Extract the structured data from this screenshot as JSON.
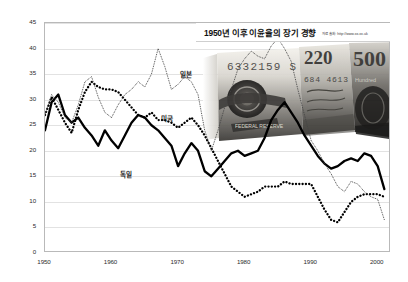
{
  "chart_data": {
    "type": "line",
    "title": "1950년 이후 이윤율의 장기 경향",
    "source_note": "자료 출처: http://www.xx.xx.uk",
    "xlabel": "",
    "ylabel": "",
    "xlim": [
      1950,
      2002
    ],
    "ylim": [
      0,
      45
    ],
    "ytick_step": 5,
    "yticks": [
      "45",
      "40",
      "35",
      "30",
      "25",
      "20",
      "15",
      "10",
      "5",
      "0"
    ],
    "xticks": [
      "1950",
      "1960",
      "1970",
      "1980",
      "1990",
      "2000"
    ],
    "grid": true,
    "legend_position": "inline-annotations",
    "series": [
      {
        "name": "미국",
        "label": "미국",
        "style": "thick-solid",
        "color": "#000000",
        "x": [
          1950,
          1951,
          1952,
          1953,
          1954,
          1955,
          1956,
          1957,
          1958,
          1959,
          1960,
          1961,
          1962,
          1963,
          1964,
          1965,
          1966,
          1967,
          1968,
          1969,
          1970,
          1971,
          1972,
          1973,
          1974,
          1975,
          1976,
          1977,
          1978,
          1979,
          1980,
          1981,
          1982,
          1983,
          1984,
          1985,
          1986,
          1987,
          1988,
          1989,
          1990,
          1991,
          1992,
          1993,
          1994,
          1995,
          1996,
          1997,
          1998,
          1999,
          2000,
          2001
        ],
        "values": [
          24.0,
          29.5,
          31.0,
          27.0,
          25.5,
          26.5,
          24.5,
          23.0,
          21.0,
          24.0,
          22.0,
          20.5,
          23.0,
          25.5,
          27.0,
          26.5,
          25.0,
          24.0,
          22.5,
          21.0,
          17.0,
          19.5,
          21.5,
          20.0,
          16.0,
          15.0,
          16.5,
          18.0,
          19.5,
          20.0,
          19.0,
          19.5,
          20.0,
          22.5,
          26.0,
          28.0,
          29.5,
          27.5,
          25.5,
          23.0,
          21.0,
          19.0,
          17.5,
          16.5,
          17.0,
          18.0,
          18.5,
          18.0,
          19.5,
          19.0,
          17.0,
          12.5
        ]
      },
      {
        "name": "독일",
        "label": "독일",
        "style": "thick-dotted",
        "color": "#000000",
        "x": [
          1950,
          1951,
          1952,
          1953,
          1954,
          1955,
          1956,
          1957,
          1958,
          1959,
          1960,
          1961,
          1962,
          1963,
          1964,
          1965,
          1966,
          1967,
          1968,
          1969,
          1970,
          1971,
          1972,
          1973,
          1974,
          1975,
          1976,
          1977,
          1978,
          1979,
          1980,
          1981,
          1982,
          1983,
          1984,
          1985,
          1986,
          1987,
          1988,
          1989,
          1990,
          1991,
          1992,
          1993,
          1994,
          1995,
          1996,
          1997,
          1998,
          1999,
          2000,
          2001
        ],
        "values": [
          27.0,
          30.5,
          28.0,
          25.5,
          23.5,
          28.0,
          31.5,
          33.5,
          32.5,
          32.0,
          32.0,
          31.5,
          30.0,
          28.5,
          27.0,
          26.5,
          27.5,
          26.0,
          26.0,
          25.5,
          24.5,
          25.5,
          26.5,
          25.0,
          23.0,
          20.5,
          18.0,
          15.5,
          13.0,
          12.0,
          11.0,
          11.5,
          12.0,
          13.0,
          13.0,
          13.0,
          14.0,
          13.5,
          13.5,
          13.5,
          13.5,
          11.0,
          8.5,
          6.5,
          6.0,
          8.0,
          10.0,
          11.0,
          11.5,
          11.5,
          11.5,
          11.0
        ]
      },
      {
        "name": "일본",
        "label": "일본",
        "style": "thin-dotted",
        "color": "#444444",
        "x": [
          1950,
          1951,
          1952,
          1953,
          1954,
          1955,
          1956,
          1957,
          1958,
          1959,
          1960,
          1961,
          1962,
          1963,
          1964,
          1965,
          1966,
          1967,
          1968,
          1969,
          1970,
          1971,
          1972,
          1973,
          1974,
          1975,
          1976,
          1977,
          1978,
          1979,
          1980,
          1981,
          1982,
          1983,
          1984,
          1985,
          1986,
          1987,
          1988,
          1989,
          1990,
          1991,
          1992,
          1993,
          1994,
          1995,
          1996,
          1997,
          1998,
          1999,
          2000,
          2001
        ],
        "values": [
          27.0,
          31.0,
          29.5,
          26.5,
          25.5,
          29.0,
          33.5,
          34.5,
          30.5,
          27.5,
          26.5,
          29.0,
          31.0,
          32.0,
          33.5,
          32.5,
          35.0,
          40.0,
          36.5,
          32.0,
          33.0,
          34.5,
          33.5,
          31.0,
          24.0,
          20.0,
          24.0,
          28.5,
          32.0,
          36.0,
          38.0,
          39.5,
          38.5,
          38.0,
          40.5,
          42.0,
          40.0,
          37.5,
          32.0,
          27.0,
          22.0,
          20.0,
          17.5,
          15.5,
          13.0,
          12.0,
          14.0,
          13.5,
          12.0,
          11.0,
          10.5,
          6.5
        ]
      }
    ]
  },
  "annotations": {
    "japan_label": "일본",
    "usa_label": "미국",
    "germany_label": "독일"
  },
  "overlay": {
    "name": "banknote-photo",
    "description": "rolled banknotes photograph"
  }
}
